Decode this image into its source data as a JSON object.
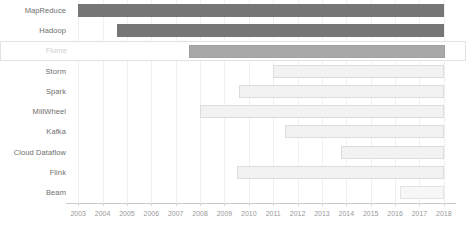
{
  "chart_data": {
    "type": "bar",
    "chart_style": "gantt-timeline",
    "title": "",
    "xlabel": "",
    "ylabel": "",
    "xlim": [
      2002.5,
      2018.5
    ],
    "grid": true,
    "legend": false,
    "x_ticks": [
      "2003",
      "2004",
      "2005",
      "2006",
      "2007",
      "2008",
      "2009",
      "2010",
      "2011",
      "2012",
      "2013",
      "2014",
      "2015",
      "2016",
      "2017",
      "2018"
    ],
    "categories": [
      "MapReduce",
      "Hadoop",
      "Flume",
      "Storm",
      "Spark",
      "MillWheel",
      "Kafka",
      "Cloud Dataflow",
      "Flink",
      "Beam"
    ],
    "series": [
      {
        "name": "MapReduce",
        "start": 2003.0,
        "end": 2018.0,
        "shade": "dark",
        "selected": false
      },
      {
        "name": "Hadoop",
        "start": 2004.6,
        "end": 2018.0,
        "shade": "dark",
        "selected": false
      },
      {
        "name": "Flume",
        "start": 2007.5,
        "end": 2018.0,
        "shade": "mid",
        "selected": true
      },
      {
        "name": "Storm",
        "start": 2011.0,
        "end": 2018.0,
        "shade": "light",
        "selected": false
      },
      {
        "name": "Spark",
        "start": 2009.6,
        "end": 2018.0,
        "shade": "light",
        "selected": false
      },
      {
        "name": "MillWheel",
        "start": 2008.0,
        "end": 2018.0,
        "shade": "light",
        "selected": false
      },
      {
        "name": "Kafka",
        "start": 2011.5,
        "end": 2018.0,
        "shade": "light",
        "selected": false
      },
      {
        "name": "Cloud Dataflow",
        "start": 2013.8,
        "end": 2018.0,
        "shade": "light",
        "selected": false
      },
      {
        "name": "Flink",
        "start": 2009.5,
        "end": 2018.0,
        "shade": "light",
        "selected": false
      },
      {
        "name": "Beam",
        "start": 2016.2,
        "end": 2018.0,
        "shade": "lighter",
        "selected": false
      }
    ],
    "colors": {
      "dark": "#767676",
      "mid": "#a8a8a8",
      "light": "#f2f2f2",
      "lighter": "#f7f7f7",
      "gridline": "#f0f0f0",
      "axis": "#c9c9c9",
      "label": "#6e6e6e",
      "tick_label": "#9a9a9a",
      "selected_border": "#e2e2e2",
      "selected_label": "#cfcfcf"
    }
  }
}
